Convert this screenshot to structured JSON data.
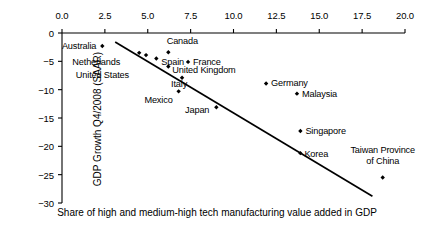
{
  "chart_data": {
    "type": "scatter",
    "title": "",
    "xlabel": "Share of high and medium-high tech manufacturing value added in GDP",
    "ylabel": "GDP Growth Q4/2008 (SAAR)",
    "xlim": [
      0.0,
      20.0
    ],
    "ylim": [
      -30,
      0
    ],
    "xticks": [
      "0.0",
      "2.5",
      "5.0",
      "7.5",
      "10.0",
      "12.5",
      "15.0",
      "17.5",
      "20.0"
    ],
    "yticks": [
      "0",
      "-5",
      "-10",
      "-15",
      "-20",
      "-25",
      "-30"
    ],
    "grid": false,
    "legend": "none",
    "points": [
      {
        "label": "Australia",
        "x": 2.35,
        "y": -2.3,
        "label_anchor": "end",
        "label_dx": -6,
        "label_dy": 0
      },
      {
        "label": "Netherlands",
        "x": 4.5,
        "y": -3.5,
        "label_anchor": "end",
        "label_dx": -19,
        "label_dy": 9
      },
      {
        "label": "United States",
        "x": 4.9,
        "y": -3.9,
        "label_anchor": "end",
        "label_dx": -17,
        "label_dy": 20
      },
      {
        "label": "Canada",
        "x": 6.2,
        "y": -3.4,
        "label_anchor": "middle",
        "label_dx": 14,
        "label_dy": -11
      },
      {
        "label": "Spain",
        "x": 5.5,
        "y": -4.5,
        "label_anchor": "start",
        "label_dx": 5,
        "label_dy": 3
      },
      {
        "label": "France",
        "x": 7.35,
        "y": -5.1,
        "label_anchor": "start",
        "label_dx": 5,
        "label_dy": 0
      },
      {
        "label": "United Kingdom",
        "x": 6.2,
        "y": -5.9,
        "label_anchor": "start",
        "label_dx": 4,
        "label_dy": 4
      },
      {
        "label": "Italy",
        "x": 7.0,
        "y": -7.9,
        "label_anchor": "middle",
        "label_dx": -3,
        "label_dy": 6
      },
      {
        "label": "Mexico",
        "x": 6.8,
        "y": -10.3,
        "label_anchor": "end",
        "label_dx": -6,
        "label_dy": 9
      },
      {
        "label": "Japan",
        "x": 9.0,
        "y": -13.1,
        "label_anchor": "end",
        "label_dx": -7,
        "label_dy": 3
      },
      {
        "label": "Germany",
        "x": 11.9,
        "y": -8.9,
        "label_anchor": "start",
        "label_dx": 5,
        "label_dy": 0
      },
      {
        "label": "Malaysia",
        "x": 13.7,
        "y": -10.7,
        "label_anchor": "start",
        "label_dx": 5,
        "label_dy": 0
      },
      {
        "label": "Singapore",
        "x": 13.9,
        "y": -17.3,
        "label_anchor": "start",
        "label_dx": 5,
        "label_dy": 0
      },
      {
        "label": "Korea",
        "x": 13.9,
        "y": -21.2,
        "label_anchor": "start",
        "label_dx": 4,
        "label_dy": 1
      },
      {
        "label": "Taiwan Province\nof China",
        "x": 18.7,
        "y": -25.5,
        "label_anchor": "middle",
        "label_dx": 0,
        "label_dy": -22
      }
    ],
    "trendline": {
      "x1": 3.1,
      "y1": -1.6,
      "x2": 18.1,
      "y2": -28.8
    }
  }
}
